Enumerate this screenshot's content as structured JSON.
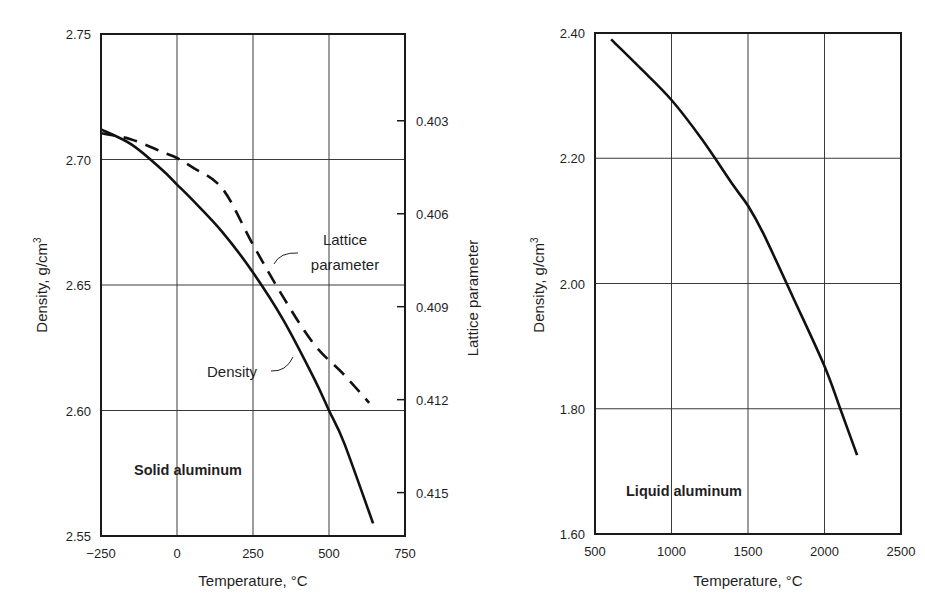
{
  "chart_data": [
    {
      "type": "line",
      "title": "Solid aluminum",
      "xlabel": "Temperature, °C",
      "ylabel": "Density, g/cm³",
      "y2label": "Lattice parameter",
      "xlim": [
        -250,
        750
      ],
      "ylim": [
        2.55,
        2.75
      ],
      "y2lim_top_to_bottom": [
        0.4002,
        0.4164
      ],
      "grid": true,
      "xticks": [
        -250,
        0,
        250,
        500,
        750
      ],
      "xtick_labels": [
        "−250",
        "0",
        "250",
        "500",
        "750"
      ],
      "yticks": [
        2.55,
        2.6,
        2.65,
        2.7,
        2.75
      ],
      "ytick_labels": [
        "2.55",
        "2.60",
        "2.65",
        "2.70",
        "2.75"
      ],
      "y2ticks": [
        0.403,
        0.406,
        0.409,
        0.412,
        0.415
      ],
      "y2tick_labels": [
        "0.403",
        "0.406",
        "0.409",
        "0.412",
        "0.415"
      ],
      "series": [
        {
          "name": "Density",
          "axis": "left",
          "style": "solid",
          "x": [
            -250,
            -150,
            -50,
            0,
            50,
            150,
            250,
            350,
            450,
            500,
            550,
            645
          ],
          "values": [
            2.712,
            2.706,
            2.696,
            2.69,
            2.684,
            2.671,
            2.655,
            2.636,
            2.613,
            2.6,
            2.587,
            2.555
          ]
        },
        {
          "name": "Lattice parameter",
          "axis": "right",
          "style": "dashed",
          "x": [
            -250,
            -150,
            -50,
            0,
            50,
            150,
            250,
            350,
            450,
            550,
            632
          ],
          "values": [
            0.4034,
            0.4036,
            0.404,
            0.4042,
            0.4045,
            0.4052,
            0.407,
            0.4087,
            0.4102,
            0.4112,
            0.4121
          ]
        }
      ],
      "annotations": [
        {
          "text": "Lattice parameter",
          "target_series": "Lattice parameter"
        },
        {
          "text": "Density",
          "target_series": "Density"
        }
      ]
    },
    {
      "type": "line",
      "title": "Liquid aluminum",
      "xlabel": "Temperature, °C",
      "ylabel": "Density, g/cm³",
      "xlim": [
        500,
        2500
      ],
      "ylim": [
        1.6,
        2.4
      ],
      "grid": true,
      "xticks": [
        500,
        1000,
        1500,
        2000,
        2500
      ],
      "xtick_labels": [
        "500",
        "1000",
        "1500",
        "2000",
        "2500"
      ],
      "yticks": [
        1.6,
        1.8,
        2.0,
        2.2,
        2.4
      ],
      "ytick_labels": [
        "1.60",
        "1.80",
        "2.00",
        "2.20",
        "2.40"
      ],
      "series": [
        {
          "name": "Density",
          "axis": "left",
          "style": "solid",
          "x": [
            605,
            800,
            1000,
            1200,
            1400,
            1500,
            1600,
            1800,
            2000,
            2100,
            2213
          ],
          "values": [
            2.39,
            2.343,
            2.293,
            2.23,
            2.158,
            2.124,
            2.08,
            1.975,
            1.868,
            1.802,
            1.726
          ]
        }
      ]
    }
  ],
  "panels": [
    {
      "label": "Solid aluminum",
      "x_title": "Temperature, °C",
      "y_title_main": "Density, g/cm",
      "y_title_sup": "3",
      "y2_title": "Lattice parameter",
      "annot_lattice_line1": "Lattice",
      "annot_lattice_line2": "parameter",
      "annot_density": "Density"
    },
    {
      "label": "Liquid aluminum",
      "x_title": "Temperature, °C",
      "y_title_main": "Density, g/cm",
      "y_title_sup": "3"
    }
  ],
  "style": {
    "line_color": "#111111",
    "grid_color": "#3a3a3a",
    "frame_color": "#1a1a1a",
    "background": "#ffffff"
  }
}
